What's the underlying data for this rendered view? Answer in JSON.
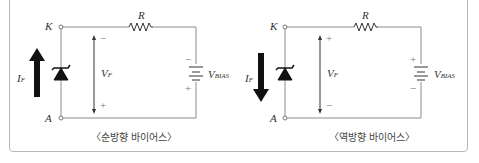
{
  "diagrams": [
    {
      "id": "forward",
      "caption": "〈순방향 바이어스〉",
      "node_top": "K",
      "node_bottom": "A",
      "resistor": "R",
      "current": {
        "main": "I",
        "sub": "F",
        "direction": "up"
      },
      "voltage": {
        "main": "V",
        "sub": "F",
        "top_sign": "−",
        "bottom_sign": "+"
      },
      "source": {
        "main": "V",
        "sub": "BIAS",
        "top_sign": "−",
        "bottom_sign": "+"
      }
    },
    {
      "id": "reverse",
      "caption": "〈역방향 바이어스〉",
      "node_top": "K",
      "node_bottom": "A",
      "resistor": "R",
      "current": {
        "main": "I",
        "sub": "F",
        "direction": "down"
      },
      "voltage": {
        "main": "V",
        "sub": "F",
        "top_sign": "+",
        "bottom_sign": "−"
      },
      "source": {
        "main": "V",
        "sub": "BIAS",
        "top_sign": "+",
        "bottom_sign": "−"
      }
    }
  ],
  "colors": {
    "wire": "#8c8c8c",
    "arrow": "#111111",
    "frame": "#b8b8b8"
  }
}
